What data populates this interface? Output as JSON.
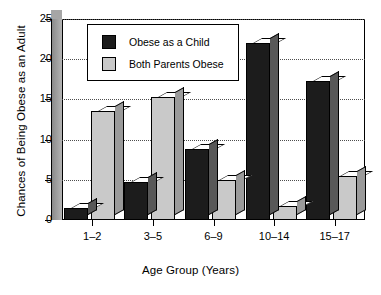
{
  "chart_data": {
    "type": "bar",
    "title": "",
    "xlabel": "Age Group (Years)",
    "ylabel": "Chances of Being Obese as an Adult",
    "categories": [
      "1–2",
      "3–5",
      "6–9",
      "10–14",
      "15–17"
    ],
    "series": [
      {
        "name": "Obese as a Child",
        "color": "#1c1c1c",
        "values": [
          1.5,
          4.7,
          8.8,
          22.0,
          17.3
        ]
      },
      {
        "name": "Both Parents Obese",
        "color": "#c9c9c9",
        "values": [
          13.5,
          15.3,
          5.0,
          1.8,
          5.5
        ]
      }
    ],
    "ylim": [
      0,
      25
    ],
    "yticks": [
      0,
      5,
      10,
      15,
      20,
      25
    ],
    "ytick_labels": [
      "0",
      "5",
      "10",
      "15",
      "20",
      "25"
    ],
    "grid": "horizontal-dotted",
    "legend_position": "top-left-inside",
    "style": "3d-bars"
  },
  "legend": {
    "items": [
      {
        "label": "Obese as a Child",
        "swatch": "black"
      },
      {
        "label": "Both Parents Obese",
        "swatch": "gray"
      }
    ]
  }
}
